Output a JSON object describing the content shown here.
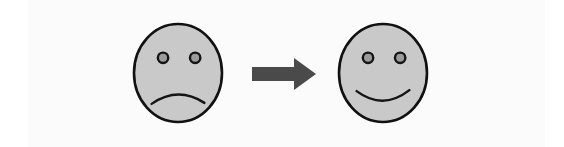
{
  "graphic": {
    "title": "Sad face transforms into happy face",
    "canvas": {
      "width": 564,
      "height": 147
    },
    "background_color": "#ffffff",
    "panel_color": "#fbfbfb",
    "face_fill_color": "#c9c9c9",
    "outline_color": "#111111",
    "eye_fill_color": "#9b9b9b",
    "arrow_color": "#4a4a4a",
    "elements": [
      {
        "id": "sad-face",
        "role": "before-state",
        "expression": "sad",
        "center_x": 178,
        "center_y": 73,
        "radius_x": 44,
        "radius_y": 49,
        "mouth": "frown",
        "eye_count": 2
      },
      {
        "id": "transition-arrow",
        "role": "transition",
        "direction": "right",
        "start_x": 252,
        "tip_x": 316,
        "center_y": 74
      },
      {
        "id": "happy-face",
        "role": "after-state",
        "expression": "happy",
        "center_x": 383,
        "center_y": 73,
        "radius_x": 44,
        "radius_y": 49,
        "mouth": "smile",
        "eye_count": 2
      }
    ]
  }
}
